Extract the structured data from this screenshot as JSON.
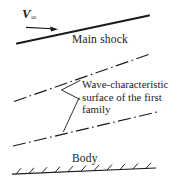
{
  "figure": {
    "background_color": "#ffffff",
    "ink_color": "#1a1a1a",
    "width": 182,
    "height": 184
  },
  "labels": {
    "freestream_symbol": "V",
    "freestream_subscript": "∞",
    "main_shock": "Main shock",
    "wave_line1": "Wave-characteristic",
    "wave_line2": "surface of the first",
    "wave_line3": "family",
    "body": "Body"
  },
  "diagram_data": {
    "type": "technical-line-diagram",
    "description": "Supersonic flow schematic: freestream velocity arrow, main shock line, two dash-dot wave-characteristic surfaces of the first family, and a hatched body surface.",
    "elements": [
      {
        "name": "freestream-arrow",
        "style": "solid-arrow",
        "from": [
          26,
          27
        ],
        "to": [
          57,
          29
        ]
      },
      {
        "name": "main-shock-line",
        "style": "solid-thick",
        "from": [
          17,
          43
        ],
        "to": [
          149,
          16
        ]
      },
      {
        "name": "upper-characteristic-line",
        "style": "dash-dot",
        "from": [
          14,
          101
        ],
        "to": [
          150,
          54
        ]
      },
      {
        "name": "lower-characteristic-line",
        "style": "dash-dot",
        "from": [
          13,
          146
        ],
        "to": [
          157,
          112
        ]
      },
      {
        "name": "body-surface-line",
        "style": "solid-hatched",
        "from": [
          12,
          174
        ],
        "to": [
          155,
          168
        ],
        "hatch_count": 11
      },
      {
        "name": "leader-upper",
        "style": "solid-thin",
        "from": [
          79,
          81
        ],
        "to": [
          62,
          90
        ]
      },
      {
        "name": "leader-middle",
        "style": "solid-thin",
        "from": [
          62,
          90
        ],
        "to": [
          80,
          99
        ]
      },
      {
        "name": "leader-lower",
        "style": "solid-thin",
        "from": [
          79,
          98
        ],
        "to": [
          64,
          131
        ]
      }
    ]
  }
}
